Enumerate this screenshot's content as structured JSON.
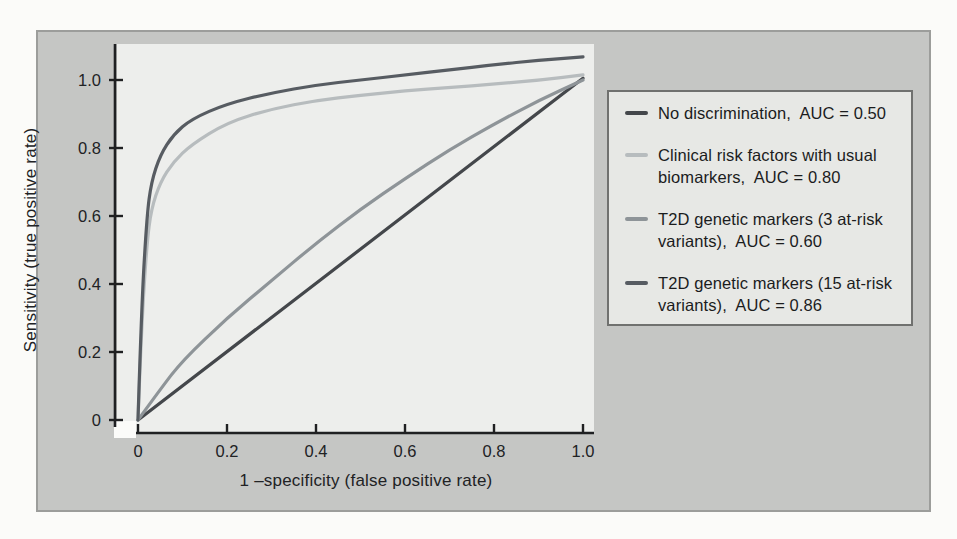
{
  "chart_data": {
    "type": "line",
    "title": "",
    "xlabel": "1 –specificity (false positive rate)",
    "ylabel": "Sensitivity (true positive rate)",
    "xlim": [
      0,
      1.0
    ],
    "ylim": [
      0,
      1.0
    ],
    "grid": false,
    "legend_position": "right-outside",
    "x_ticks": [
      {
        "value": 0,
        "label": "0"
      },
      {
        "value": 0.2,
        "label": "0.2"
      },
      {
        "value": 0.4,
        "label": "0.4"
      },
      {
        "value": 0.6,
        "label": "0.6"
      },
      {
        "value": 0.8,
        "label": "0.8"
      },
      {
        "value": 1.0,
        "label": "1.0"
      }
    ],
    "y_ticks": [
      {
        "value": 0,
        "label": "0"
      },
      {
        "value": 0.2,
        "label": "0.2"
      },
      {
        "value": 0.4,
        "label": "0.4"
      },
      {
        "value": 0.6,
        "label": "0.6"
      },
      {
        "value": 0.8,
        "label": "0.8"
      },
      {
        "value": 1.0,
        "label": "1.0"
      }
    ],
    "series": [
      {
        "name": "No discrimination",
        "auc": 0.5,
        "color": "#44474b",
        "points": [
          [
            0,
            0
          ],
          [
            1.0,
            1.005
          ]
        ]
      },
      {
        "name": "Clinical risk factors with usual biomarkers",
        "auc": 0.8,
        "color": "#b7bcbe",
        "points": [
          [
            0,
            0
          ],
          [
            0.008,
            0.28
          ],
          [
            0.02,
            0.52
          ],
          [
            0.03,
            0.62
          ],
          [
            0.05,
            0.7
          ],
          [
            0.08,
            0.76
          ],
          [
            0.12,
            0.81
          ],
          [
            0.2,
            0.875
          ],
          [
            0.3,
            0.915
          ],
          [
            0.4,
            0.94
          ],
          [
            0.5,
            0.955
          ],
          [
            0.6,
            0.968
          ],
          [
            0.7,
            0.978
          ],
          [
            0.8,
            0.988
          ],
          [
            0.9,
            0.999
          ],
          [
            1.0,
            1.015
          ]
        ]
      },
      {
        "name": "T2D genetic markers (3 at-risk variants)",
        "auc": 0.6,
        "color": "#8e9498",
        "points": [
          [
            0,
            0
          ],
          [
            0.05,
            0.09
          ],
          [
            0.1,
            0.175
          ],
          [
            0.2,
            0.3
          ],
          [
            0.3,
            0.41
          ],
          [
            0.4,
            0.52
          ],
          [
            0.5,
            0.62
          ],
          [
            0.6,
            0.71
          ],
          [
            0.7,
            0.795
          ],
          [
            0.8,
            0.87
          ],
          [
            0.9,
            0.94
          ],
          [
            1.0,
            1.0
          ]
        ]
      },
      {
        "name": "T2D genetic markers (15 at-risk variants)",
        "auc": 0.86,
        "color": "#575c62",
        "points": [
          [
            0,
            0
          ],
          [
            0.008,
            0.34
          ],
          [
            0.02,
            0.6
          ],
          [
            0.03,
            0.7
          ],
          [
            0.05,
            0.78
          ],
          [
            0.08,
            0.84
          ],
          [
            0.12,
            0.885
          ],
          [
            0.2,
            0.93
          ],
          [
            0.3,
            0.962
          ],
          [
            0.4,
            0.985
          ],
          [
            0.5,
            1.0
          ],
          [
            0.6,
            1.015
          ],
          [
            0.7,
            1.03
          ],
          [
            0.8,
            1.045
          ],
          [
            0.9,
            1.058
          ],
          [
            1.0,
            1.068
          ]
        ]
      }
    ]
  },
  "legend": {
    "items": [
      {
        "series": 0,
        "lines": [
          "No discrimination,  AUC = 0.50"
        ]
      },
      {
        "series": 1,
        "lines": [
          "Clinical risk factors with usual",
          "biomarkers,  AUC = 0.80"
        ]
      },
      {
        "series": 2,
        "lines": [
          "T2D genetic markers (3 at-risk",
          "variants),  AUC = 0.60"
        ]
      },
      {
        "series": 3,
        "lines": [
          "T2D genetic markers (15 at-risk",
          "variants),  AUC = 0.86"
        ]
      }
    ]
  },
  "colors": {
    "panel_background": "#c5c6c4",
    "plot_background": "#edeeec",
    "legend_background": "#e7e8e5",
    "axis": "#1f2022"
  }
}
